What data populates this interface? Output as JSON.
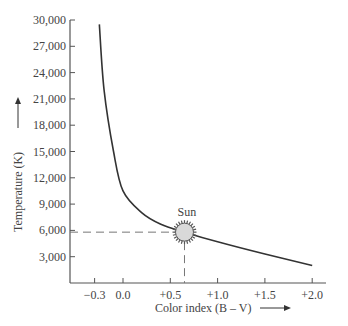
{
  "chart_data": {
    "type": "line",
    "title": "",
    "xlabel": "Color index (B – V) →",
    "ylabel": "Temperature (K) →",
    "xlim": [
      -0.5,
      2.0
    ],
    "ylim": [
      0,
      30000
    ],
    "x_ticks": [
      "−0.3",
      "0.0",
      "+0.5",
      "+1.0",
      "+1.5",
      "+2.0"
    ],
    "y_ticks": [
      "3,000",
      "6,000",
      "9,000",
      "12,000",
      "15,000",
      "18,000",
      "21,000",
      "24,000",
      "27,000",
      "30,000"
    ],
    "series": [
      {
        "name": "Temperature vs color index",
        "x": [
          -0.25,
          -0.2,
          -0.1,
          0.0,
          0.2,
          0.4,
          0.65,
          1.0,
          1.5,
          2.0
        ],
        "y": [
          29500,
          22000,
          15000,
          10500,
          8000,
          6700,
          5800,
          4700,
          3300,
          2000
        ]
      }
    ],
    "annotations": [
      {
        "label": "Sun",
        "x": 0.65,
        "y": 5800,
        "note": "dashed guide lines to both axes"
      }
    ],
    "grid": false
  },
  "labels": {
    "x_axis": "Color index (B – V)",
    "y_axis": "Temperature (K)",
    "sun": "Sun"
  }
}
